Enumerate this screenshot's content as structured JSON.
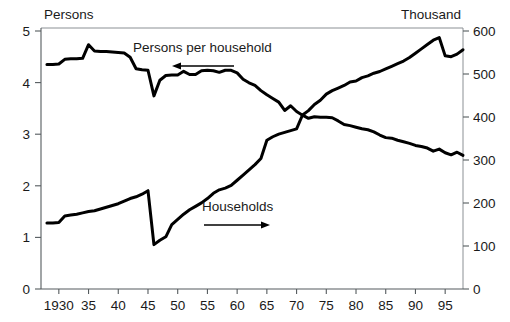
{
  "chart_data": {
    "type": "line",
    "title": "",
    "xlabel": "",
    "ylabel": "Persons",
    "y2label": "Thousand",
    "left_axis_title": "Persons",
    "right_axis_title": "Thousand",
    "grid": false,
    "legend": "inline-annotations",
    "x": [
      1928,
      1929,
      1930,
      1931,
      1932,
      1933,
      1934,
      1935,
      1936,
      1937,
      1938,
      1939,
      1940,
      1941,
      1942,
      1943,
      1944,
      1945,
      1946,
      1947,
      1948,
      1949,
      1950,
      1951,
      1952,
      1953,
      1954,
      1955,
      1956,
      1957,
      1958,
      1959,
      1960,
      1961,
      1962,
      1963,
      1964,
      1965,
      1966,
      1967,
      1968,
      1969,
      1970,
      1971,
      1972,
      1973,
      1974,
      1975,
      1976,
      1977,
      1978,
      1979,
      1980,
      1981,
      1982,
      1983,
      1984,
      1985,
      1986,
      1987,
      1988,
      1989,
      1990,
      1991,
      1992,
      1993,
      1994,
      1995,
      1996,
      1997,
      1998
    ],
    "xlim": [
      1927,
      1998
    ],
    "xticks": [
      1930,
      1935,
      1940,
      1945,
      1950,
      1955,
      1960,
      1965,
      1970,
      1975,
      1980,
      1985,
      1990,
      1995
    ],
    "xticklabels": [
      "1930",
      "35",
      "40",
      "45",
      "50",
      "55",
      "60",
      "65",
      "70",
      "75",
      "80",
      "85",
      "90",
      "95"
    ],
    "ylim": [
      0,
      5
    ],
    "yticks": [
      0,
      1,
      2,
      3,
      4,
      5
    ],
    "yticklabels": [
      "0",
      "1",
      "2",
      "3",
      "4",
      "5"
    ],
    "y2lim": [
      0,
      600
    ],
    "y2ticks": [
      0,
      100,
      200,
      300,
      400,
      500,
      600
    ],
    "y2ticklabels": [
      "0",
      "100",
      "200",
      "300",
      "400",
      "500",
      "600"
    ],
    "series": [
      {
        "name": "Persons per household",
        "axis": "left",
        "units": "persons",
        "annotation_label": "Persons per household",
        "annotation_arrow_direction": "left",
        "values": [
          4.3,
          4.3,
          4.31,
          4.4,
          4.41,
          4.41,
          4.42,
          4.68,
          4.56,
          4.55,
          4.55,
          4.54,
          4.53,
          4.52,
          4.44,
          4.22,
          4.2,
          4.19,
          3.7,
          4.0,
          4.09,
          4.1,
          4.1,
          4.17,
          4.11,
          4.11,
          4.18,
          4.19,
          4.18,
          4.15,
          4.19,
          4.19,
          4.14,
          4.02,
          3.95,
          3.9,
          3.8,
          3.72,
          3.65,
          3.58,
          3.42,
          3.51,
          3.4,
          3.33,
          3.27,
          3.3,
          3.29,
          3.29,
          3.28,
          3.22,
          3.15,
          3.13,
          3.1,
          3.07,
          3.05,
          3.01,
          2.95,
          2.9,
          2.89,
          2.85,
          2.82,
          2.79,
          2.75,
          2.73,
          2.7,
          2.64,
          2.68,
          2.61,
          2.57,
          2.62,
          2.56
        ]
      },
      {
        "name": "Households",
        "axis": "right",
        "units": "thousand",
        "annotation_label": "Households",
        "annotation_arrow_direction": "right",
        "values": [
          152,
          152,
          153,
          168,
          170,
          172,
          175,
          178,
          180,
          184,
          188,
          192,
          196,
          202,
          208,
          212,
          218,
          226,
          102,
          112,
          120,
          148,
          160,
          172,
          182,
          190,
          198,
          208,
          220,
          228,
          232,
          238,
          250,
          262,
          274,
          286,
          300,
          342,
          350,
          356,
          360,
          364,
          368,
          400,
          410,
          424,
          434,
          448,
          456,
          462,
          468,
          476,
          478,
          486,
          490,
          496,
          500,
          506,
          512,
          518,
          524,
          532,
          542,
          552,
          562,
          572,
          578,
          536,
          534,
          540,
          550
        ]
      }
    ],
    "annotations": [
      {
        "text": "Persons per household",
        "arrow": "left"
      },
      {
        "text": "Households",
        "arrow": "right"
      }
    ]
  },
  "axes": {
    "left_title": "Persons",
    "right_title": "Thousand",
    "left_tick_labels": [
      "5",
      "4",
      "3",
      "2",
      "1",
      "0"
    ],
    "right_tick_labels": [
      "600",
      "500",
      "400",
      "300",
      "200",
      "100",
      "0"
    ],
    "x_tick_labels": [
      "1930",
      "35",
      "40",
      "45",
      "50",
      "55",
      "60",
      "65",
      "70",
      "75",
      "80",
      "85",
      "90",
      "95"
    ]
  },
  "colors": {
    "line": "#000000",
    "axis": "#555b5e",
    "frame": "#8b9094",
    "text": "#1a1a1a",
    "background": "#ffffff"
  }
}
